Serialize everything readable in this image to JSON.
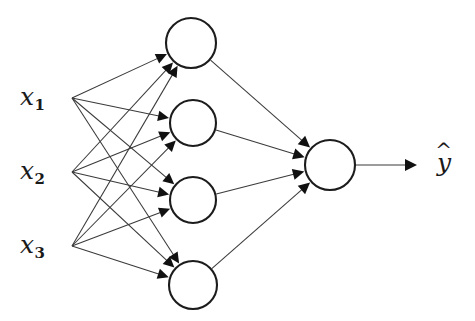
{
  "figure": {
    "kind": "neural-network-diagram",
    "title": "",
    "background_color": "#ffffff",
    "stroke_color": "#3a3a3a",
    "node_stroke_color": "#1c1c1c",
    "node_fill_color": "#ffffff",
    "arrow_fill_color": "#111111"
  },
  "input_layer": {
    "name": "input-layer",
    "count": 3,
    "nodes": [
      {
        "id": "x1",
        "base": "x",
        "sub": "1",
        "label": "x1",
        "x": 72,
        "y": 98,
        "label_x": 20,
        "label_y": 84
      },
      {
        "id": "x2",
        "base": "x",
        "sub": "2",
        "label": "x2",
        "x": 72,
        "y": 172,
        "label_x": 20,
        "label_y": 158
      },
      {
        "id": "x3",
        "base": "x",
        "sub": "3",
        "label": "x3",
        "x": 72,
        "y": 246,
        "label_x": 20,
        "label_y": 232
      }
    ]
  },
  "hidden_layer": {
    "name": "hidden-layer",
    "count": 4,
    "radius": 24,
    "nodes": [
      {
        "id": "h1",
        "cx": 191,
        "cy": 43,
        "r": 25
      },
      {
        "id": "h2",
        "cx": 193,
        "cy": 123,
        "r": 23
      },
      {
        "id": "h3",
        "cx": 193,
        "cy": 200,
        "r": 23
      },
      {
        "id": "h4",
        "cx": 193,
        "cy": 285,
        "r": 24
      }
    ]
  },
  "output_layer": {
    "name": "output-layer",
    "count": 1,
    "nodes": [
      {
        "id": "o1",
        "cx": 330,
        "cy": 165,
        "r": 25
      }
    ]
  },
  "output_label": {
    "base": "y",
    "hat": "^",
    "label": "y-hat",
    "label_x": 437,
    "label_y": 150
  },
  "output_arrow": {
    "from_x": 356,
    "from_y": 165,
    "to_x": 417,
    "to_y": 165
  },
  "connections": {
    "input_to_hidden": [
      {
        "from": "x1",
        "to": "h1"
      },
      {
        "from": "x1",
        "to": "h2"
      },
      {
        "from": "x1",
        "to": "h3"
      },
      {
        "from": "x1",
        "to": "h4"
      },
      {
        "from": "x2",
        "to": "h1"
      },
      {
        "from": "x2",
        "to": "h2"
      },
      {
        "from": "x2",
        "to": "h3"
      },
      {
        "from": "x2",
        "to": "h4"
      },
      {
        "from": "x3",
        "to": "h1"
      },
      {
        "from": "x3",
        "to": "h2"
      },
      {
        "from": "x3",
        "to": "h3"
      },
      {
        "from": "x3",
        "to": "h4"
      }
    ],
    "hidden_to_output": [
      {
        "from": "h1",
        "to": "o1"
      },
      {
        "from": "h2",
        "to": "o1"
      },
      {
        "from": "h3",
        "to": "o1"
      },
      {
        "from": "h4",
        "to": "o1"
      }
    ]
  }
}
